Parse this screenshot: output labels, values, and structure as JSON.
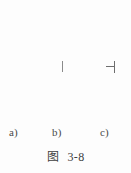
{
  "figure": {
    "caption_prefix": "图",
    "caption_number": "3-8",
    "background_color": "#fdfdfd",
    "line_color": "#585858",
    "mark_color": "#6e6e6e",
    "text_color": "#3d3d3d"
  },
  "subfigures": [
    {
      "id": "a",
      "label": "a)",
      "description": "plain vertical line, no marks"
    },
    {
      "id": "b",
      "label": "b)",
      "description": "vertical line with a short detached vertical tick at its right side"
    },
    {
      "id": "c",
      "label": "c)",
      "description": "vertical line with a horizontal connector joining a short vertical tick, forming an H shape"
    }
  ]
}
